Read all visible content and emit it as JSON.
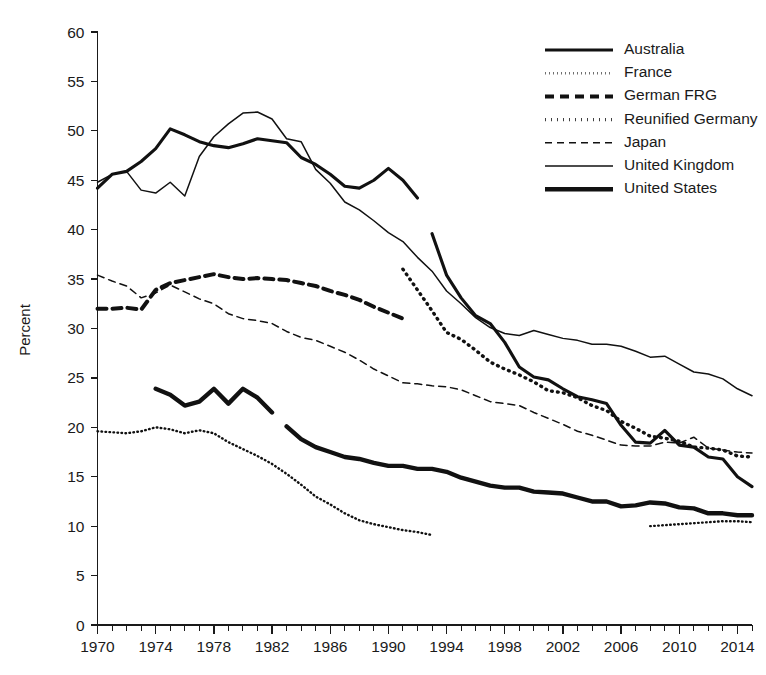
{
  "chart_data": {
    "type": "line",
    "title": "",
    "xlabel": "",
    "ylabel": "Percent",
    "xlim": [
      1970,
      2015
    ],
    "ylim": [
      0,
      60
    ],
    "ytick_step": 5,
    "xtick_step": 4,
    "xtick_minor_step": 1,
    "grid": false,
    "legend_position": "top-right",
    "yticks": [
      0,
      5,
      10,
      15,
      20,
      25,
      30,
      35,
      40,
      45,
      50,
      55,
      60
    ],
    "xticks": [
      1970,
      1974,
      1978,
      1982,
      1986,
      1990,
      1994,
      1998,
      2002,
      2006,
      2010,
      2014
    ],
    "series": [
      {
        "name": "Australia",
        "style": "solid-thick",
        "stroke_width": 3.1,
        "dash": "none",
        "color": "#111111",
        "x": [
          1970,
          1971,
          1972,
          1973,
          1974,
          1975,
          1976,
          1977,
          1978,
          1979,
          1980,
          1981,
          1982,
          1983,
          1984,
          1985,
          1986,
          1987,
          1988,
          1989,
          1990,
          1991,
          1992
        ],
        "values": [
          44.2,
          45.6,
          45.9,
          46.9,
          48.2,
          50.2,
          49.6,
          48.9,
          48.5,
          48.3,
          48.7,
          49.2,
          49.0,
          48.8,
          47.3,
          46.6,
          45.6,
          44.4,
          44.2,
          45.0,
          46.2,
          45.0,
          43.2
        ]
      },
      {
        "name": "Australia (cont.)",
        "style": "solid-thick",
        "stroke_width": 3.1,
        "dash": "none",
        "color": "#111111",
        "x": [
          1993,
          1994,
          1995,
          1996,
          1997,
          1998,
          1999,
          2000,
          2001,
          2002,
          2003,
          2004,
          2005,
          2006,
          2007,
          2008,
          2009,
          2010,
          2011,
          2012,
          2013,
          2014,
          2015
        ],
        "values": [
          39.6,
          35.4,
          33.1,
          31.3,
          30.5,
          28.6,
          26.1,
          25.1,
          24.8,
          23.9,
          23.1,
          22.8,
          22.4,
          20.2,
          18.5,
          18.4,
          19.7,
          18.2,
          18.0,
          17.0,
          16.8,
          15.0,
          14.0
        ]
      },
      {
        "name": "France",
        "style": "dotted-fine",
        "stroke_width": 2.4,
        "dash": "0.6 3.4",
        "color": "#111111",
        "x": [
          1970,
          1971,
          1972,
          1973,
          1974,
          1975,
          1976,
          1977,
          1978,
          1979,
          1980,
          1981,
          1982,
          1983,
          1984,
          1985,
          1986,
          1987,
          1988,
          1989,
          1990,
          1991,
          1992,
          1993
        ],
        "values": [
          19.6,
          19.5,
          19.4,
          19.6,
          20.0,
          19.8,
          19.4,
          19.7,
          19.4,
          18.5,
          17.8,
          17.1,
          16.3,
          15.3,
          14.2,
          13.0,
          12.2,
          11.3,
          10.6,
          10.2,
          9.9,
          9.6,
          9.4,
          9.1
        ]
      },
      {
        "name": "France (cont.)",
        "style": "dotted-fine",
        "stroke_width": 2.4,
        "dash": "0.6 3.4",
        "color": "#111111",
        "x": [
          2008,
          2009,
          2010,
          2011,
          2012,
          2013,
          2014,
          2015
        ],
        "values": [
          10.0,
          10.1,
          10.2,
          10.3,
          10.4,
          10.5,
          10.5,
          10.4
        ]
      },
      {
        "name": "German FRG",
        "style": "dashed-thick",
        "stroke_width": 4.0,
        "dash": "9 6",
        "color": "#111111",
        "x": [
          1970,
          1971,
          1972,
          1973,
          1974,
          1975,
          1976,
          1977,
          1978,
          1979,
          1980,
          1981,
          1982,
          1983,
          1984,
          1985,
          1986,
          1987,
          1988,
          1989,
          1990,
          1991
        ],
        "values": [
          32.0,
          32.0,
          32.1,
          31.9,
          33.9,
          34.6,
          34.9,
          35.2,
          35.5,
          35.2,
          35.0,
          35.1,
          35.0,
          34.9,
          34.6,
          34.3,
          33.8,
          33.4,
          32.9,
          32.2,
          31.6,
          31.0
        ]
      },
      {
        "name": "Reunified Germany",
        "style": "dotted-bold",
        "stroke_width": 3.4,
        "dash": "0.8 5.2",
        "color": "#111111",
        "x": [
          1991,
          1992,
          1993,
          1994,
          1995,
          1996,
          1997,
          1998,
          1999,
          2000,
          2001,
          2002,
          2003,
          2004,
          2005,
          2006,
          2007,
          2008,
          2009,
          2010,
          2011,
          2012,
          2013,
          2014,
          2015
        ],
        "values": [
          36.0,
          33.9,
          31.8,
          29.6,
          28.9,
          27.8,
          26.6,
          25.9,
          25.3,
          24.6,
          23.7,
          23.5,
          23.0,
          22.2,
          21.7,
          20.6,
          19.9,
          19.1,
          18.9,
          18.6,
          18.0,
          17.9,
          17.7,
          17.1,
          17.0
        ]
      },
      {
        "name": "Japan",
        "style": "dashed-fine",
        "stroke_width": 1.5,
        "dash": "7 5",
        "color": "#111111",
        "x": [
          1970,
          1971,
          1972,
          1973,
          1974,
          1975,
          1976,
          1977,
          1978,
          1979,
          1980,
          1981,
          1982,
          1983,
          1984,
          1985,
          1986,
          1987,
          1988,
          1989,
          1990,
          1991,
          1992,
          1993,
          1994,
          1995,
          1996,
          1997,
          1998,
          1999,
          2000,
          2001,
          2002,
          2003,
          2004,
          2005,
          2006,
          2007,
          2008,
          2009,
          2010,
          2011,
          2012,
          2013,
          2014,
          2015
        ],
        "values": [
          35.4,
          34.8,
          34.3,
          33.1,
          33.6,
          34.4,
          33.7,
          33.0,
          32.5,
          31.5,
          31.0,
          30.8,
          30.5,
          29.7,
          29.1,
          28.8,
          28.2,
          27.6,
          26.8,
          25.9,
          25.2,
          24.5,
          24.4,
          24.2,
          24.1,
          23.8,
          23.2,
          22.6,
          22.4,
          22.2,
          21.5,
          20.9,
          20.3,
          19.6,
          19.2,
          18.7,
          18.2,
          18.1,
          18.1,
          18.5,
          18.4,
          19.0,
          17.9,
          17.7,
          17.5,
          17.4
        ]
      },
      {
        "name": "United Kingdom",
        "style": "solid-thin",
        "stroke_width": 1.5,
        "dash": "none",
        "color": "#111111",
        "x": [
          1970,
          1971,
          1972,
          1973,
          1974,
          1975,
          1976,
          1977,
          1978,
          1979,
          1980,
          1981,
          1982,
          1983,
          1984,
          1985,
          1986,
          1987,
          1988,
          1989,
          1990,
          1991,
          1992,
          1993,
          1994,
          1995,
          1996,
          1997,
          1998,
          1999,
          2000,
          2001,
          2002,
          2003,
          2004,
          2005,
          2006,
          2007,
          2008,
          2009,
          2010,
          2011,
          2012,
          2013,
          2014,
          2015
        ],
        "values": [
          44.8,
          45.6,
          45.9,
          44.0,
          43.7,
          44.8,
          43.4,
          47.4,
          49.4,
          50.7,
          51.8,
          51.9,
          51.2,
          49.2,
          48.9,
          46.1,
          44.7,
          42.8,
          42.0,
          40.9,
          39.7,
          38.8,
          37.2,
          35.8,
          33.8,
          32.5,
          31.1,
          30.1,
          29.5,
          29.3,
          29.8,
          29.4,
          29.0,
          28.8,
          28.4,
          28.4,
          28.2,
          27.7,
          27.1,
          27.2,
          26.4,
          25.6,
          25.4,
          24.9,
          23.9,
          23.2
        ]
      },
      {
        "name": "United States",
        "style": "solid-extra-thick",
        "stroke_width": 4.4,
        "dash": "none",
        "color": "#111111",
        "x": [
          1974,
          1975,
          1976,
          1977,
          1978,
          1979,
          1980,
          1981,
          1982
        ],
        "values": [
          23.9,
          23.3,
          22.2,
          22.6,
          23.9,
          22.4,
          23.9,
          23.0,
          21.5
        ]
      },
      {
        "name": "United States (cont.)",
        "style": "solid-extra-thick",
        "stroke_width": 4.4,
        "dash": "none",
        "color": "#111111",
        "x": [
          1983,
          1984,
          1985,
          1986,
          1987,
          1988,
          1989,
          1990,
          1991,
          1992,
          1993,
          1994,
          1995,
          1996,
          1997,
          1998,
          1999,
          2000,
          2001,
          2002,
          2003,
          2004,
          2005,
          2006,
          2007,
          2008,
          2009,
          2010,
          2011,
          2012,
          2013,
          2014,
          2015
        ],
        "values": [
          20.1,
          18.8,
          18.0,
          17.5,
          17.0,
          16.8,
          16.4,
          16.1,
          16.1,
          15.8,
          15.8,
          15.5,
          14.9,
          14.5,
          14.1,
          13.9,
          13.9,
          13.5,
          13.4,
          13.3,
          12.9,
          12.5,
          12.5,
          12.0,
          12.1,
          12.4,
          12.3,
          11.9,
          11.8,
          11.3,
          11.3,
          11.1,
          11.1
        ]
      }
    ],
    "legend": [
      {
        "label": "Australia",
        "style": "solid-thick",
        "stroke_width": 3.1,
        "dash": "none"
      },
      {
        "label": "France",
        "style": "dotted-fine",
        "stroke_width": 2.4,
        "dash": "0.6 3.4"
      },
      {
        "label": "German FRG",
        "style": "dashed-thick",
        "stroke_width": 4.0,
        "dash": "9 6"
      },
      {
        "label": "Reunified Germany",
        "style": "dotted-bold",
        "stroke_width": 3.4,
        "dash": "0.8 5.2"
      },
      {
        "label": "Japan",
        "style": "dashed-fine",
        "stroke_width": 1.5,
        "dash": "7 5"
      },
      {
        "label": "United Kingdom",
        "style": "solid-thin",
        "stroke_width": 1.5,
        "dash": "none"
      },
      {
        "label": "United States",
        "style": "solid-extra-thick",
        "stroke_width": 4.4,
        "dash": "none"
      }
    ]
  },
  "colors": {
    "ink": "#111111",
    "background": "#ffffff"
  }
}
